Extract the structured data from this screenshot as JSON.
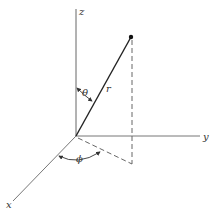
{
  "diagram": {
    "labels": {
      "z_axis": "z",
      "y_axis": "y",
      "x_axis": "x",
      "radius": "r",
      "theta": "θ",
      "phi": "ϕ"
    },
    "colors": {
      "axis": "#555555",
      "vector": "#222222",
      "dashed": "#555555",
      "background": "#ffffff"
    }
  }
}
